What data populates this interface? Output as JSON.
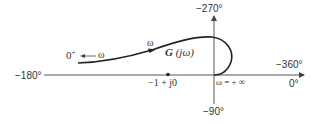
{
  "diagram": {
    "axes": {
      "left_label": "−180°",
      "top_label": "−270°",
      "right_label_top": "−360°",
      "right_label_bottom": "0°",
      "bottom_label": "−90°"
    },
    "curve": {
      "name": "G (jω)",
      "name_prefix": "G",
      "name_arg": "(jω)",
      "start_label": "0",
      "start_label_sup": "+",
      "start_arrow_label": "ω",
      "mid_arrow_label": "ω",
      "end_label": "ω = + ∞"
    },
    "critical_point": {
      "label": "−1 + j0"
    },
    "colors": {
      "line": "#222222",
      "axis": "#555555",
      "text": "#333333",
      "background": "#ffffff"
    }
  }
}
